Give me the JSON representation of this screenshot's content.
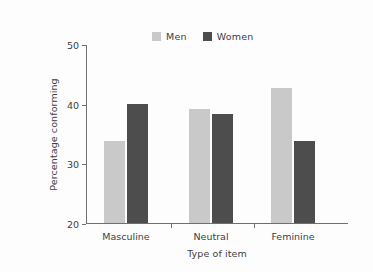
{
  "chart_data": {
    "type": "bar",
    "title": "",
    "xlabel": "Type of item",
    "ylabel": "Percentage conforming",
    "categories": [
      "Masculine",
      "Neutral",
      "Feminine"
    ],
    "series": [
      {
        "name": "Men",
        "color": "#c9c9c9",
        "values": [
          33.7,
          39.1,
          42.6
        ]
      },
      {
        "name": "Women",
        "color": "#4d4d4d",
        "values": [
          40.0,
          38.2,
          33.7
        ]
      }
    ],
    "ylim": [
      20,
      50
    ],
    "yticks": [
      20,
      30,
      40,
      50
    ],
    "ytick_labels": [
      "20",
      "30",
      "40",
      "50"
    ],
    "grid": false,
    "legend_position": "top-center"
  },
  "legend": {
    "entries": [
      {
        "label": "Men"
      },
      {
        "label": "Women"
      }
    ]
  }
}
